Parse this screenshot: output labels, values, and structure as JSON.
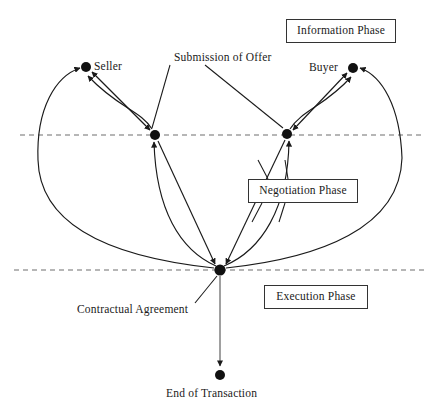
{
  "diagram": {
    "type": "flow-diagram",
    "background_color": "#ffffff",
    "line_color": "#1a1a1a",
    "node_color": "#111111",
    "dash_color": "#6e6e6e",
    "nodes": [
      {
        "id": "seller",
        "label": "Seller",
        "x": 86,
        "y": 67,
        "r": 5.0,
        "label_dx": 8,
        "label_dy": -7
      },
      {
        "id": "buyer",
        "label": "Buyer",
        "x": 353,
        "y": 68,
        "r": 5.0,
        "label_dx": -44,
        "label_dy": -7
      },
      {
        "id": "neg_left",
        "label": "",
        "x": 155,
        "y": 135,
        "r": 5.0,
        "label_dx": 0,
        "label_dy": 0
      },
      {
        "id": "neg_right",
        "label": "",
        "x": 287,
        "y": 134,
        "r": 5.0,
        "label_dx": 0,
        "label_dy": 0
      },
      {
        "id": "contract",
        "label": "Contractual Agreement",
        "x": 220,
        "y": 270,
        "r": 5.5,
        "label_dx": -143,
        "label_dy": 35
      },
      {
        "id": "end",
        "label": "End of Transaction",
        "x": 220,
        "y": 375,
        "r": 5.0,
        "label_dx": -54,
        "label_dy": 12
      }
    ],
    "edge_label": {
      "text": "Submission of Offer",
      "x": 174,
      "y": 57
    },
    "phase_boxes": [
      {
        "id": "information-phase",
        "label": "Information Phase",
        "x": 286,
        "y": 19,
        "w": 110,
        "h": 24
      },
      {
        "id": "negotiation-phase",
        "label": "Negotiation Phase",
        "x": 248,
        "y": 179,
        "w": 110,
        "h": 24
      },
      {
        "id": "execution-phase",
        "label": "Execution Phase",
        "x": 264,
        "y": 285,
        "w": 104,
        "h": 24
      }
    ],
    "phase_dividers": [
      {
        "id": "divider-information-negotiation",
        "y": 135,
        "x1": 20,
        "x2": 424
      },
      {
        "id": "divider-negotiation-execution",
        "y": 270,
        "x1": 14,
        "x2": 424
      }
    ]
  }
}
